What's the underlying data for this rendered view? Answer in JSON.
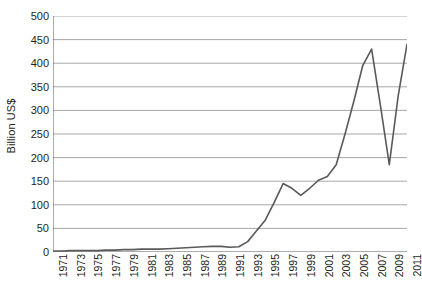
{
  "chart_data": {
    "type": "line",
    "title": "",
    "xlabel": "",
    "ylabel": "Billion US$",
    "ylim": [
      0,
      500
    ],
    "ytick_values": [
      0,
      50,
      100,
      150,
      200,
      250,
      300,
      350,
      400,
      450,
      500
    ],
    "ytick_labels": [
      "0",
      "50",
      "100",
      "150",
      "200",
      "250",
      "300",
      "350",
      "400",
      "450",
      "500"
    ],
    "grid": true,
    "legend": "none",
    "x": [
      1971,
      1972,
      1973,
      1974,
      1975,
      1976,
      1977,
      1978,
      1979,
      1980,
      1981,
      1982,
      1983,
      1984,
      1985,
      1986,
      1987,
      1988,
      1989,
      1990,
      1991,
      1992,
      1993,
      1994,
      1995,
      1996,
      1997,
      1998,
      1999,
      2000,
      2001,
      2002,
      2003,
      2004,
      2005,
      2006,
      2007,
      2008,
      2009,
      2010,
      2011
    ],
    "xtick_labels": [
      "1971",
      "1973",
      "1975",
      "1977",
      "1979",
      "1981",
      "1983",
      "1985",
      "1987",
      "1989",
      "1991",
      "1993",
      "1995",
      "1997",
      "1999",
      "2001",
      "2003",
      "2005",
      "2007",
      "2009",
      "2011"
    ],
    "xtick_years": [
      1971,
      1973,
      1975,
      1977,
      1979,
      1981,
      1983,
      1985,
      1987,
      1989,
      1991,
      1993,
      1995,
      1997,
      1999,
      2001,
      2003,
      2005,
      2007,
      2009,
      2011
    ],
    "values": [
      2,
      2,
      3,
      3,
      3,
      3,
      4,
      4,
      5,
      5,
      6,
      6,
      6,
      7,
      8,
      9,
      10,
      11,
      12,
      12,
      10,
      11,
      22,
      45,
      68,
      105,
      145,
      135,
      120,
      135,
      152,
      160,
      185,
      250,
      320,
      395,
      430,
      310,
      185,
      330,
      440
    ],
    "line_color": "#595959",
    "grid_color": "#9d9d9d",
    "axis_color": "#595959",
    "background": "#ffffff"
  }
}
